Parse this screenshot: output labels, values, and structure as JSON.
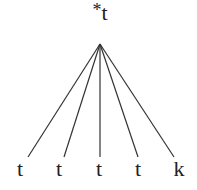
{
  "diagram": {
    "type": "tree",
    "root": {
      "marker": "*",
      "label": "t",
      "x": 100,
      "y": 2,
      "apex": {
        "x": 100,
        "y": 44
      }
    },
    "leaves": [
      {
        "label": "t",
        "x": 20,
        "line_end_x": 28
      },
      {
        "label": "t",
        "x": 59,
        "line_end_x": 64
      },
      {
        "label": "t",
        "x": 99,
        "line_end_x": 100
      },
      {
        "label": "t",
        "x": 138,
        "line_end_x": 138
      },
      {
        "label": "k",
        "x": 179,
        "line_end_x": 174
      }
    ],
    "line_end_y": 157,
    "leaf_label_y": 158,
    "line_color": "#333333"
  }
}
